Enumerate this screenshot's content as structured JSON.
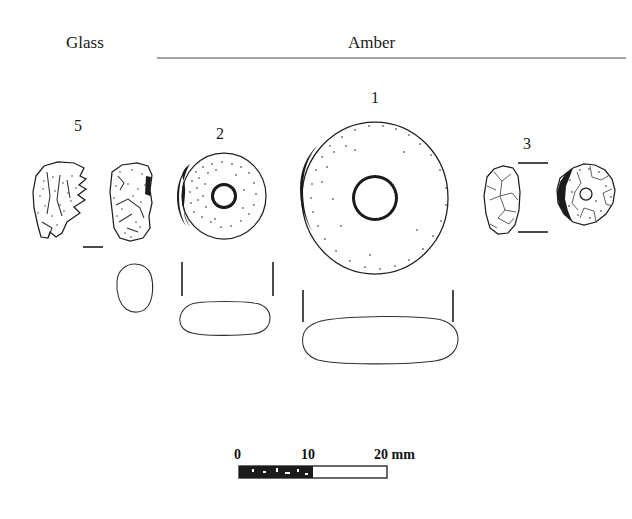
{
  "figure": {
    "type": "archaeological-finds-plate"
  },
  "headers": {
    "glass": "Glass",
    "amber": "Amber"
  },
  "items": [
    {
      "id": "5",
      "label": "5",
      "material": "Glass",
      "views": [
        "fragment-a",
        "fragment-b",
        "section"
      ]
    },
    {
      "id": "2",
      "label": "2",
      "material": "Amber",
      "views": [
        "face",
        "section"
      ]
    },
    {
      "id": "1",
      "label": "1",
      "material": "Amber",
      "views": [
        "face",
        "section"
      ]
    },
    {
      "id": "3",
      "label": "3",
      "material": "Amber",
      "views": [
        "profile",
        "face"
      ]
    }
  ],
  "scale": {
    "unit": "mm",
    "ticks": [
      "0",
      "10",
      "20 mm"
    ],
    "values": [
      0,
      10,
      20
    ],
    "total_mm": 20
  },
  "colors": {
    "ink": "#1d1d1d",
    "paper": "#ffffff",
    "rule": "#4a4a4a"
  }
}
